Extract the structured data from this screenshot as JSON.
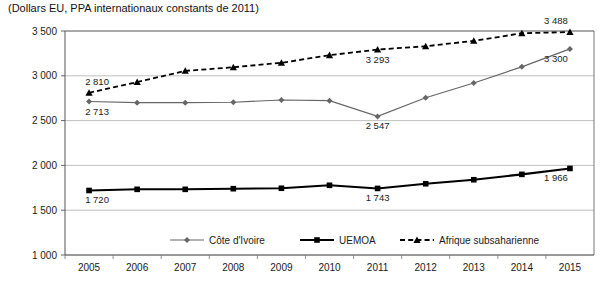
{
  "chart_data": {
    "type": "line",
    "title": "(Dollars EU, PPA internationaux constants de 2011)",
    "xlabel": "",
    "ylabel": "",
    "ylim": [
      1000,
      3500
    ],
    "ytick_step": 500,
    "ytick_labels": [
      "3 500",
      "3 000",
      "2 500",
      "2 000",
      "1 500",
      "1 000"
    ],
    "ytick_values": [
      3500,
      3000,
      2500,
      2000,
      1500,
      1000
    ],
    "grid": true,
    "legend_position": "bottom",
    "categories": [
      "2005",
      "2006",
      "2007",
      "2008",
      "2009",
      "2010",
      "2011",
      "2012",
      "2013",
      "2014",
      "2015"
    ],
    "x": [
      2005,
      2006,
      2007,
      2008,
      2009,
      2010,
      2011,
      2012,
      2013,
      2014,
      2015
    ],
    "series": [
      {
        "name": "Côte d'Ivoire",
        "marker": "diamond",
        "line_style": "solid",
        "color": "#666666",
        "values": [
          2713,
          2700,
          2700,
          2705,
          2730,
          2722,
          2547,
          2755,
          2920,
          3100,
          3300
        ],
        "labels": [
          {
            "index": 0,
            "text": "2 713",
            "position": "below"
          },
          {
            "index": 6,
            "text": "2 547",
            "position": "below"
          },
          {
            "index": 10,
            "text": "3 300",
            "position": "below"
          }
        ]
      },
      {
        "name": "UEMOA",
        "marker": "square",
        "line_style": "solid",
        "color": "#000000",
        "values": [
          1720,
          1733,
          1733,
          1740,
          1745,
          1778,
          1743,
          1795,
          1840,
          1900,
          1966
        ],
        "labels": [
          {
            "index": 0,
            "text": "1 720",
            "position": "below"
          },
          {
            "index": 6,
            "text": "1 743",
            "position": "below"
          },
          {
            "index": 10,
            "text": "1 966",
            "position": "below"
          }
        ]
      },
      {
        "name": "Afrique subsaharienne",
        "marker": "triangle",
        "line_style": "dashed",
        "color": "#000000",
        "values": [
          2810,
          2930,
          3055,
          3095,
          3145,
          3230,
          3293,
          3330,
          3390,
          3475,
          3488
        ],
        "labels": [
          {
            "index": 0,
            "text": "2 810",
            "position": "above"
          },
          {
            "index": 6,
            "text": "3 293",
            "position": "below"
          },
          {
            "index": 10,
            "text": "3 488",
            "position": "above"
          }
        ]
      }
    ]
  },
  "legend": {
    "items": [
      {
        "label": "Côte d'Ivoire",
        "marker": "diamond",
        "style": "solid",
        "color": "#666666"
      },
      {
        "label": "UEMOA",
        "marker": "square",
        "style": "solid",
        "color": "#000000"
      },
      {
        "label": "Afrique subsaharienne",
        "marker": "triangle",
        "style": "dashed",
        "color": "#000000"
      }
    ]
  }
}
